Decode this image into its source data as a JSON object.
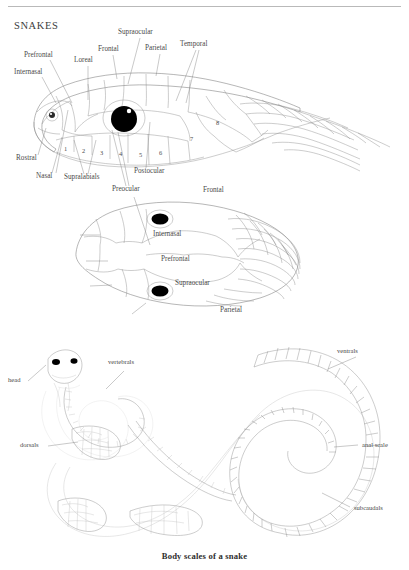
{
  "page": {
    "title": "SNAKES",
    "caption": "Body scales of a snake",
    "ink_color": "#8f8f8f",
    "label_color": "#4a4a4a",
    "background": "#ffffff"
  },
  "figures": [
    {
      "id": "lateral-head",
      "view": "lateral head scalation",
      "labels": [
        {
          "name": "Prefrontal",
          "x": 24,
          "y": 56
        },
        {
          "name": "Internasal",
          "x": 14,
          "y": 73
        },
        {
          "name": "Loreal",
          "x": 76,
          "y": 61
        },
        {
          "name": "Frontal",
          "x": 100,
          "y": 50
        },
        {
          "name": "Supraocular",
          "x": 120,
          "y": 33
        },
        {
          "name": "Parietal",
          "x": 147,
          "y": 49
        },
        {
          "name": "Temporal",
          "x": 182,
          "y": 45
        },
        {
          "name": "Rostral",
          "x": 18,
          "y": 159
        },
        {
          "name": "Nasal",
          "x": 38,
          "y": 177
        },
        {
          "name": "Supralabials",
          "x": 66,
          "y": 178
        },
        {
          "name": "Preocular",
          "x": 114,
          "y": 190
        },
        {
          "name": "Postocular",
          "x": 136,
          "y": 172
        }
      ],
      "numbered_scales": [
        "1",
        "2",
        "3",
        "4",
        "5",
        "6",
        "7",
        "8"
      ],
      "supralabial_numbers": [
        "1",
        "2",
        "3",
        "4",
        "5",
        "6"
      ],
      "temporal_numbers": [
        "7",
        "8"
      ]
    },
    {
      "id": "dorsal-head",
      "view": "dorsal head scalation",
      "labels": [
        {
          "name": "Frontal",
          "x": 203,
          "y": 191
        },
        {
          "name": "Internasal",
          "x": 155,
          "y": 235
        },
        {
          "name": "Prefrontal",
          "x": 163,
          "y": 259
        },
        {
          "name": "Supraocular",
          "x": 177,
          "y": 283
        },
        {
          "name": "Parietal",
          "x": 222,
          "y": 310
        }
      ]
    },
    {
      "id": "body-scales",
      "view": "whole body scalation",
      "labels": [
        {
          "name": "head",
          "x": 10,
          "y": 381
        },
        {
          "name": "vertebrals",
          "x": 110,
          "y": 363
        },
        {
          "name": "dorsals",
          "x": 22,
          "y": 446
        },
        {
          "name": "ventrals",
          "x": 338,
          "y": 352
        },
        {
          "name": "anal scale",
          "x": 363,
          "y": 446
        },
        {
          "name": "subcaudals",
          "x": 355,
          "y": 509
        }
      ]
    }
  ]
}
